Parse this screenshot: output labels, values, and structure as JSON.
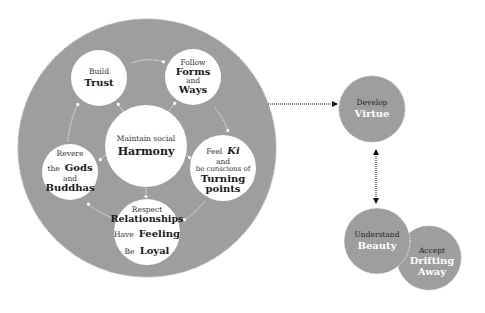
{
  "colors": {
    "main_circle": "#9e9e9e",
    "inner_node": "#ffffff",
    "outer_node": "#9e9e9e",
    "arrow_inner": "#ffffff",
    "arrow_outer": "#111111",
    "text_dark": "#1a1a1a",
    "text_light": "#ffffff"
  },
  "main_cycle": {
    "center": {
      "pre": "Maintain social",
      "main": "Harmony"
    },
    "nodes": [
      {
        "id": "trust",
        "pre": "Build",
        "main": "Trust"
      },
      {
        "id": "forms",
        "pre": "Follow",
        "main": "Forms",
        "mid": "and",
        "main2": "Ways"
      },
      {
        "id": "ki",
        "pre": "Feel",
        "main_italic": "Ki",
        "mid": "and",
        "mid2": "be conscious of",
        "main": "Turning",
        "main2": "points"
      },
      {
        "id": "relationships",
        "pre": "Respect",
        "main": "Relationships",
        "pre2": "Have",
        "main2": "Feeling",
        "pre3": "Be",
        "main3": "Loyal"
      },
      {
        "id": "gods",
        "pre": "Revere",
        "pre_b": "the",
        "main": "Gods",
        "mid": "and",
        "main2": "Buddhas"
      }
    ]
  },
  "outer_nodes": [
    {
      "id": "virtue",
      "pre": "Develop",
      "main": "Virtue"
    },
    {
      "id": "beauty",
      "pre": "Understand",
      "main": "Beauty"
    },
    {
      "id": "drifting",
      "pre": "Accept",
      "main": "Drifting",
      "main2": "Away"
    }
  ],
  "arrows": [
    {
      "from": "main-cycle",
      "to": "virtue",
      "type": "dotted-single"
    },
    {
      "from": "virtue",
      "to": "beauty",
      "type": "dotted-double"
    }
  ]
}
